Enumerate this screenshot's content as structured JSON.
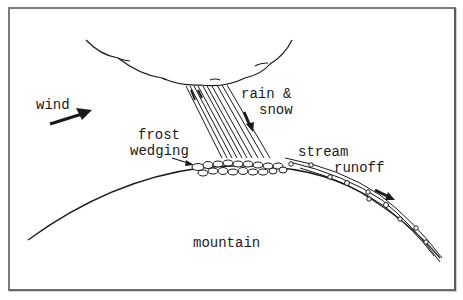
{
  "diagram": {
    "type": "process-illustration",
    "labels": {
      "wind": "wind",
      "rain_line1": "rain &",
      "rain_line2": "snow",
      "frost_line1": "frost",
      "frost_line2": "wedging",
      "stream": "stream",
      "runoff": "runoff",
      "mountain": "mountain"
    },
    "elements": [
      {
        "name": "cloud",
        "description": "scalloped cloud outline at top"
      },
      {
        "name": "precipitation",
        "description": "slanted band of lines falling from cloud to mountain top"
      },
      {
        "name": "wind-arrow",
        "direction": "right/up-right"
      },
      {
        "name": "precipitation-arrow",
        "direction": "down"
      },
      {
        "name": "frost-wedging-arrow",
        "direction": "points to rock pile"
      },
      {
        "name": "rock-pile",
        "description": "broken rock fragments at summit"
      },
      {
        "name": "mountain-profile",
        "description": "arched curve"
      },
      {
        "name": "stream-runoff",
        "description": "parallel lines with pebbles down right slope"
      },
      {
        "name": "runoff-arrow",
        "direction": "down-right"
      }
    ],
    "colors": {
      "line": "#1a1a1a",
      "frame": "#7a7a7a",
      "background": "#ffffff"
    }
  }
}
